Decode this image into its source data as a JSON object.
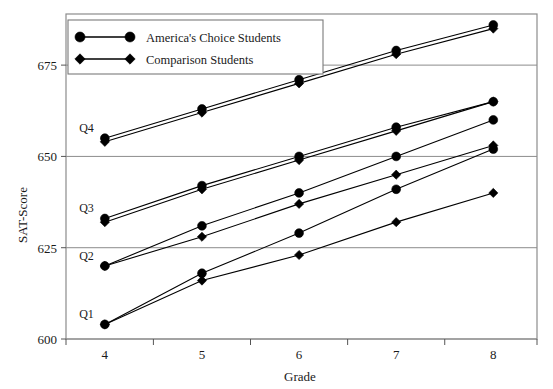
{
  "chart_data": {
    "type": "line",
    "title": "",
    "xlabel": "Grade",
    "ylabel": "SAT-Score",
    "x": [
      4,
      5,
      6,
      7,
      8
    ],
    "xticklabels": [
      "4",
      "5",
      "6",
      "7",
      "8"
    ],
    "yticklabels": [
      "600",
      "625",
      "650",
      "675"
    ],
    "yticks": [
      600,
      625,
      650,
      675
    ],
    "ylim": [
      600,
      689
    ],
    "xlim": [
      3.6,
      8.45
    ],
    "grid": "horizontal",
    "legend_position": "top-left",
    "legend": [
      {
        "name": "America's Choice Students",
        "marker": "circle"
      },
      {
        "name": "Comparison Students",
        "marker": "diamond"
      }
    ],
    "group_labels": [
      "Q1",
      "Q2",
      "Q3",
      "Q4"
    ],
    "series": [
      {
        "name": "Q4 America's Choice Students",
        "group": "Q4",
        "marker": "circle",
        "values": [
          655,
          663,
          671,
          679,
          686
        ]
      },
      {
        "name": "Q4 Comparison Students",
        "group": "Q4",
        "marker": "diamond",
        "values": [
          654,
          662,
          670,
          678,
          685
        ]
      },
      {
        "name": "Q3 America's Choice Students",
        "group": "Q3",
        "marker": "circle",
        "values": [
          633,
          642,
          650,
          658,
          665
        ]
      },
      {
        "name": "Q3 Comparison Students",
        "group": "Q3",
        "marker": "diamond",
        "values": [
          632,
          641,
          649,
          657,
          665
        ]
      },
      {
        "name": "Q2 America's Choice Students",
        "group": "Q2",
        "marker": "circle",
        "values": [
          620,
          631,
          640,
          650,
          660
        ]
      },
      {
        "name": "Q2 Comparison Students",
        "group": "Q2",
        "marker": "diamond",
        "values": [
          620,
          628,
          637,
          645,
          653
        ]
      },
      {
        "name": "Q1 America's Choice Students",
        "group": "Q1",
        "marker": "circle",
        "values": [
          604,
          618,
          629,
          641,
          652
        ]
      },
      {
        "name": "Q1 Comparison Students",
        "group": "Q1",
        "marker": "diamond",
        "values": [
          604,
          616,
          623,
          632,
          640
        ]
      }
    ],
    "colors": {
      "line": "#000000",
      "marker": "#000000",
      "grid": "#8c8c8c",
      "background": "#ffffff"
    }
  }
}
